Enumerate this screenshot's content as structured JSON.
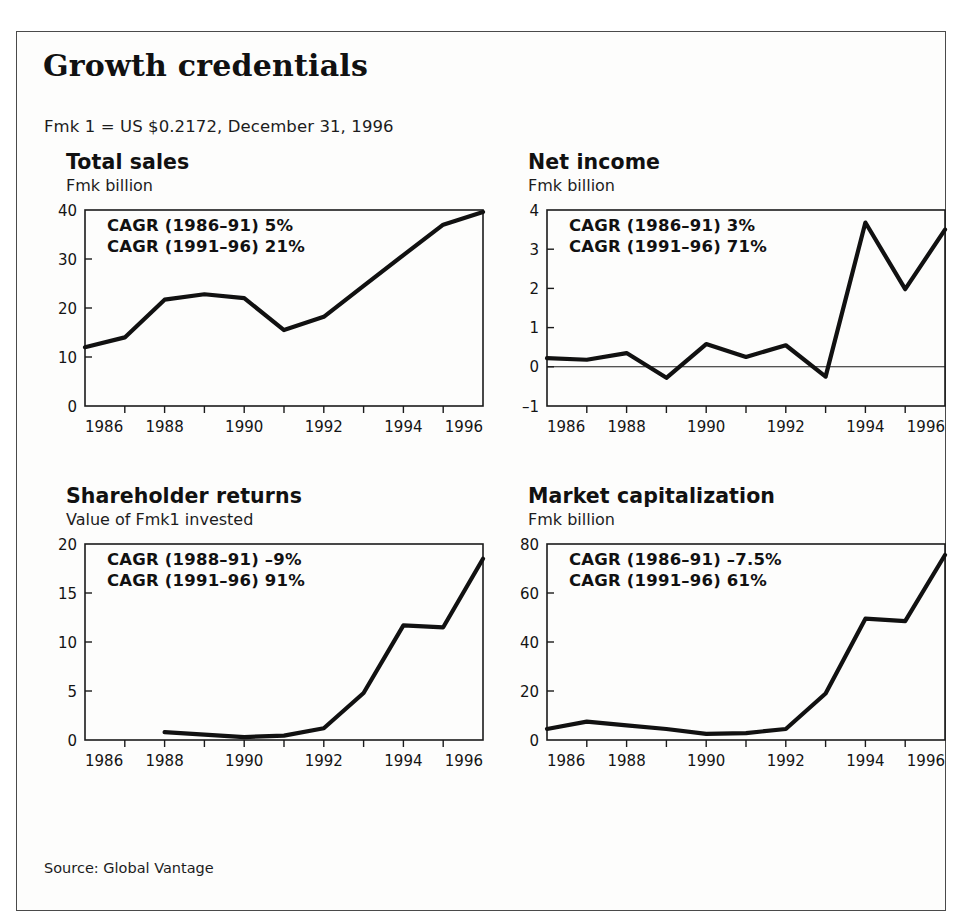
{
  "exhibit": {
    "title": "Growth credentials",
    "subtitle": "Fmk 1 = US $0.2172, December 31, 1996",
    "source": "Source: Global Vantage",
    "border_color": "#4a4a4a",
    "line_color": "#111111",
    "background": "#fdfdfc"
  },
  "panels": [
    {
      "id": "total-sales",
      "title": "Total sales",
      "subtitle": "Fmk billion",
      "cagr_line1": "CAGR (1986–91) 5%",
      "cagr_line2": "CAGR (1991–96) 21%"
    },
    {
      "id": "net-income",
      "title": "Net income",
      "subtitle": "Fmk billion",
      "cagr_line1": "CAGR (1986–91) 3%",
      "cagr_line2": "CAGR (1991–96) 71%"
    },
    {
      "id": "shareholder-returns",
      "title": "Shareholder returns",
      "subtitle": "Value of Fmk1 invested",
      "cagr_line1": "CAGR (1988–91) –9%",
      "cagr_line2": "CAGR (1991–96) 91%"
    },
    {
      "id": "market-capitalization",
      "title": "Market capitalization",
      "subtitle": "Fmk billion",
      "cagr_line1": "CAGR (1986–91) –7.5%",
      "cagr_line2": "CAGR (1991–96) 61%"
    }
  ],
  "chart_data": [
    {
      "type": "line",
      "id": "total-sales",
      "title": "Total sales",
      "subtitle": "Fmk billion",
      "ylabel": "Fmk billion",
      "xlabel": "",
      "x": [
        1986,
        1987,
        1988,
        1989,
        1990,
        1991,
        1992,
        1993,
        1994,
        1995,
        1996
      ],
      "values": [
        12.0,
        14.0,
        21.7,
        22.8,
        22.0,
        15.5,
        18.2,
        24.5,
        30.8,
        37.0,
        39.6
      ],
      "xlim": [
        1986,
        1996
      ],
      "ylim": [
        0,
        40
      ],
      "yticks": [
        0,
        10,
        20,
        30,
        40
      ],
      "yticklabels": [
        "0",
        "10",
        "20",
        "30",
        "40"
      ],
      "xticks": [
        1986,
        1988,
        1990,
        1992,
        1994,
        1996
      ],
      "xticklabels": [
        "1986",
        "1988",
        "1990",
        "1992",
        "1994",
        "1996"
      ],
      "minor_xticks": [
        1987,
        1989,
        1991,
        1993,
        1995
      ],
      "grid": false,
      "legend": "none",
      "zero_line": false,
      "annotations": [
        "CAGR (1986–91) 5%",
        "CAGR (1991–96) 21%"
      ]
    },
    {
      "type": "line",
      "id": "net-income",
      "title": "Net income",
      "subtitle": "Fmk billion",
      "ylabel": "Fmk billion",
      "xlabel": "",
      "x": [
        1986,
        1987,
        1988,
        1989,
        1990,
        1991,
        1992,
        1993,
        1994,
        1995,
        1996
      ],
      "values": [
        0.22,
        0.18,
        0.35,
        -0.28,
        0.58,
        0.25,
        0.55,
        -0.25,
        3.68,
        1.98,
        3.5
      ],
      "xlim": [
        1986,
        1996
      ],
      "ylim": [
        -1,
        4
      ],
      "yticks": [
        -1,
        0,
        1,
        2,
        3,
        4
      ],
      "yticklabels": [
        "–1",
        "0",
        "1",
        "2",
        "3",
        "4"
      ],
      "xticks": [
        1986,
        1988,
        1990,
        1992,
        1994,
        1996
      ],
      "xticklabels": [
        "1986",
        "1988",
        "1990",
        "1992",
        "1994",
        "1996"
      ],
      "minor_xticks": [
        1987,
        1989,
        1991,
        1993,
        1995
      ],
      "grid": false,
      "legend": "none",
      "zero_line": true,
      "annotations": [
        "CAGR (1986–91) 3%",
        "CAGR (1991–96) 71%"
      ]
    },
    {
      "type": "line",
      "id": "shareholder-returns",
      "title": "Shareholder returns",
      "subtitle": "Value of Fmk1 invested",
      "ylabel": "Value of Fmk1 invested",
      "xlabel": "",
      "x": [
        1988,
        1989,
        1990,
        1991,
        1992,
        1993,
        1994,
        1995,
        1996
      ],
      "values": [
        0.8,
        0.55,
        0.3,
        0.45,
        1.2,
        4.8,
        11.7,
        11.5,
        18.5
      ],
      "xlim": [
        1986,
        1996
      ],
      "ylim": [
        0,
        20
      ],
      "yticks": [
        0,
        5,
        10,
        15,
        20
      ],
      "yticklabels": [
        "0",
        "5",
        "10",
        "15",
        "20"
      ],
      "xticks": [
        1986,
        1988,
        1990,
        1992,
        1994,
        1996
      ],
      "xticklabels": [
        "1986",
        "1988",
        "1990",
        "1992",
        "1994",
        "1996"
      ],
      "minor_xticks": [
        1987,
        1989,
        1991,
        1993,
        1995
      ],
      "grid": false,
      "legend": "none",
      "zero_line": false,
      "annotations": [
        "CAGR (1988–91) –9%",
        "CAGR (1991–96) 91%"
      ]
    },
    {
      "type": "line",
      "id": "market-capitalization",
      "title": "Market capitalization",
      "subtitle": "Fmk billion",
      "ylabel": "Fmk billion",
      "xlabel": "",
      "x": [
        1986,
        1987,
        1988,
        1989,
        1990,
        1991,
        1992,
        1993,
        1994,
        1995,
        1996
      ],
      "values": [
        4.5,
        7.5,
        6.0,
        4.5,
        2.5,
        2.8,
        4.5,
        19.0,
        49.5,
        48.5,
        75.5
      ],
      "xlim": [
        1986,
        1996
      ],
      "ylim": [
        0,
        80
      ],
      "yticks": [
        0,
        20,
        40,
        60,
        80
      ],
      "yticklabels": [
        "0",
        "20",
        "40",
        "60",
        "80"
      ],
      "xticks": [
        1986,
        1988,
        1990,
        1992,
        1994,
        1996
      ],
      "xticklabels": [
        "1986",
        "1988",
        "1990",
        "1992",
        "1994",
        "1996"
      ],
      "minor_xticks": [
        1987,
        1989,
        1991,
        1993,
        1995
      ],
      "grid": false,
      "legend": "none",
      "zero_line": false,
      "annotations": [
        "CAGR (1986–91) –7.5%",
        "CAGR (1991–96) 61%"
      ]
    }
  ]
}
